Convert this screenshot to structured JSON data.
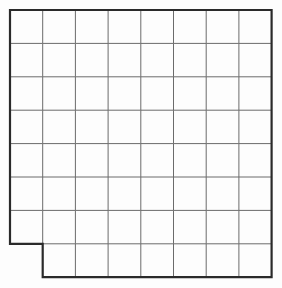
{
  "figure": {
    "kind": "grid-diagram",
    "canvas": {
      "width": 282,
      "height": 288
    },
    "background_color": "#fdfdfd"
  },
  "grid": {
    "columns": 8,
    "rows": 8,
    "cell_width": 32.7,
    "cell_height": 33.4,
    "origin_x": 10,
    "origin_y": 10,
    "total_cells": 64,
    "removed_cells": 1,
    "filled_cells": 63,
    "removed_cell_label": "row 8, column 1",
    "interior_line_color": "#6b6b6b",
    "interior_line_width": 1,
    "outline_color": "#2a2a2a",
    "outline_width": 2.2
  },
  "chart_data": {
    "type": "heatmap",
    "xlabel": "",
    "ylabel": "",
    "columns": 8,
    "rows": 8,
    "x": [
      1,
      2,
      3,
      4,
      5,
      6,
      7,
      8
    ],
    "y": [
      1,
      2,
      3,
      4,
      5,
      6,
      7,
      8
    ],
    "grid": true,
    "legend": "none",
    "values": [
      [
        1,
        1,
        1,
        1,
        1,
        1,
        1,
        1
      ],
      [
        1,
        1,
        1,
        1,
        1,
        1,
        1,
        1
      ],
      [
        1,
        1,
        1,
        1,
        1,
        1,
        1,
        1
      ],
      [
        1,
        1,
        1,
        1,
        1,
        1,
        1,
        1
      ],
      [
        1,
        1,
        1,
        1,
        1,
        1,
        1,
        1
      ],
      [
        1,
        1,
        1,
        1,
        1,
        1,
        1,
        1
      ],
      [
        1,
        1,
        1,
        1,
        1,
        1,
        1,
        1
      ],
      [
        0,
        1,
        1,
        1,
        1,
        1,
        1,
        1
      ]
    ],
    "annotations": []
  }
}
